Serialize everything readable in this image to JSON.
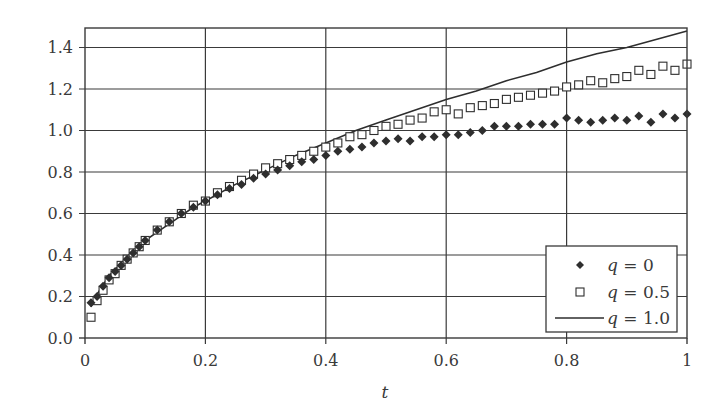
{
  "chart_data": {
    "type": "scatter",
    "title": "",
    "xlabel": "t",
    "ylabel": "",
    "xlim": [
      0,
      1
    ],
    "ylim": [
      0,
      1.5
    ],
    "grid": true,
    "x_ticks": [
      "0",
      "0.2",
      "0.4",
      "0.6",
      "0.8",
      "1"
    ],
    "y_ticks": [
      "0.0",
      "0.2",
      "0.4",
      "0.6",
      "0.8",
      "1.0",
      "1.2",
      "1.4"
    ],
    "legend_position": "lower right",
    "series": [
      {
        "name": "q = 0",
        "marker": "diamond",
        "style": "filled",
        "x": [
          0.01,
          0.02,
          0.03,
          0.04,
          0.05,
          0.06,
          0.07,
          0.08,
          0.09,
          0.1,
          0.12,
          0.14,
          0.16,
          0.18,
          0.2,
          0.22,
          0.24,
          0.26,
          0.28,
          0.3,
          0.32,
          0.34,
          0.36,
          0.38,
          0.4,
          0.42,
          0.44,
          0.46,
          0.48,
          0.5,
          0.52,
          0.54,
          0.56,
          0.58,
          0.6,
          0.62,
          0.64,
          0.66,
          0.68,
          0.7,
          0.72,
          0.74,
          0.76,
          0.78,
          0.8,
          0.82,
          0.84,
          0.86,
          0.88,
          0.9,
          0.92,
          0.94,
          0.96,
          0.98,
          1.0
        ],
        "y": [
          0.17,
          0.2,
          0.25,
          0.29,
          0.32,
          0.35,
          0.38,
          0.41,
          0.44,
          0.47,
          0.52,
          0.56,
          0.6,
          0.63,
          0.66,
          0.69,
          0.72,
          0.74,
          0.77,
          0.79,
          0.81,
          0.83,
          0.85,
          0.86,
          0.88,
          0.9,
          0.91,
          0.92,
          0.94,
          0.95,
          0.96,
          0.95,
          0.97,
          0.97,
          0.98,
          0.98,
          0.99,
          1.0,
          1.02,
          1.02,
          1.02,
          1.03,
          1.03,
          1.03,
          1.06,
          1.05,
          1.04,
          1.05,
          1.06,
          1.05,
          1.07,
          1.04,
          1.08,
          1.06,
          1.08
        ]
      },
      {
        "name": "q = 0.5",
        "marker": "square",
        "style": "open",
        "x": [
          0.01,
          0.02,
          0.03,
          0.04,
          0.05,
          0.06,
          0.07,
          0.08,
          0.09,
          0.1,
          0.12,
          0.14,
          0.16,
          0.18,
          0.2,
          0.22,
          0.24,
          0.26,
          0.28,
          0.3,
          0.32,
          0.34,
          0.36,
          0.38,
          0.4,
          0.42,
          0.44,
          0.46,
          0.48,
          0.5,
          0.52,
          0.54,
          0.56,
          0.58,
          0.6,
          0.62,
          0.64,
          0.66,
          0.68,
          0.7,
          0.72,
          0.74,
          0.76,
          0.78,
          0.8,
          0.82,
          0.84,
          0.86,
          0.88,
          0.9,
          0.92,
          0.94,
          0.96,
          0.98,
          1.0
        ],
        "y": [
          0.1,
          0.18,
          0.23,
          0.28,
          0.31,
          0.35,
          0.38,
          0.41,
          0.44,
          0.47,
          0.52,
          0.56,
          0.6,
          0.64,
          0.66,
          0.7,
          0.73,
          0.76,
          0.79,
          0.82,
          0.84,
          0.86,
          0.88,
          0.9,
          0.92,
          0.94,
          0.97,
          0.98,
          1.0,
          1.02,
          1.03,
          1.05,
          1.06,
          1.09,
          1.1,
          1.08,
          1.11,
          1.12,
          1.13,
          1.15,
          1.16,
          1.17,
          1.18,
          1.19,
          1.21,
          1.22,
          1.24,
          1.23,
          1.25,
          1.26,
          1.29,
          1.27,
          1.31,
          1.29,
          1.32
        ]
      },
      {
        "name": "q = 1.0",
        "marker": "none",
        "style": "line",
        "x": [
          0.01,
          0.02,
          0.04,
          0.06,
          0.08,
          0.1,
          0.12,
          0.14,
          0.16,
          0.18,
          0.2,
          0.25,
          0.3,
          0.35,
          0.4,
          0.45,
          0.5,
          0.55,
          0.6,
          0.65,
          0.7,
          0.75,
          0.8,
          0.85,
          0.9,
          0.95,
          1.0
        ],
        "y": [
          0.15,
          0.21,
          0.3,
          0.36,
          0.42,
          0.47,
          0.51,
          0.55,
          0.59,
          0.63,
          0.66,
          0.74,
          0.81,
          0.88,
          0.94,
          1.0,
          1.05,
          1.1,
          1.15,
          1.19,
          1.24,
          1.28,
          1.33,
          1.37,
          1.4,
          1.44,
          1.48
        ]
      }
    ]
  },
  "axes": {
    "x_label": "t",
    "x_tick_labels": [
      "0",
      "0.2",
      "0.4",
      "0.6",
      "0.8",
      "1"
    ],
    "y_tick_labels": [
      "0.0",
      "0.2",
      "0.4",
      "0.6",
      "0.8",
      "1.0",
      "1.2",
      "1.4"
    ]
  },
  "legend": {
    "items": [
      {
        "var": "q",
        "eq": " = 0",
        "marker": "diamond"
      },
      {
        "var": "q",
        "eq": " = 0.5",
        "marker": "square"
      },
      {
        "var": "q",
        "eq": " = 1.0",
        "marker": "line"
      }
    ]
  },
  "colors": {
    "axis": "#3a3a3a",
    "grid": "#3a3a3a",
    "series": "#2e2e2e",
    "background": "#ffffff"
  }
}
